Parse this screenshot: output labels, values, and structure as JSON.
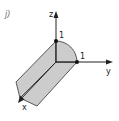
{
  "figure": {
    "panel_label": "j)",
    "axes": {
      "z_label": "z",
      "y_label": "y",
      "x_label": "x"
    },
    "points": {
      "z_one_label": "1",
      "y_one_label": "1"
    },
    "colors": {
      "fill": "#cccccc",
      "stroke": "#222222",
      "background": "#ffffff"
    }
  }
}
